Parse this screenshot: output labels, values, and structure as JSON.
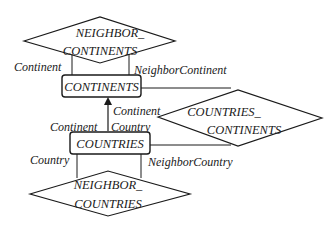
{
  "diagram": {
    "type": "entity-relationship",
    "entities": [
      {
        "id": "continents",
        "label": "CONTINENTS"
      },
      {
        "id": "countries",
        "label": "COUNTRIES"
      }
    ],
    "relationships": [
      {
        "id": "neighbor_continents",
        "line1": "NEIGHBOR_",
        "line2": "CONTINENTS"
      },
      {
        "id": "countries_continents",
        "line1": "COUNTRIES_",
        "line2": "CONTINENTS"
      },
      {
        "id": "neighbor_countries",
        "line1": "NEIGHBOR_",
        "line2": "COUNTRIES"
      }
    ],
    "roles": {
      "nc_left": "Continent",
      "nc_right": "NeighborContinent",
      "arrow_top": "Continent",
      "countries_left": "Continent",
      "countries_right": "Country",
      "ncty_left": "Country",
      "ncty_right": "NeighborCountry"
    }
  }
}
